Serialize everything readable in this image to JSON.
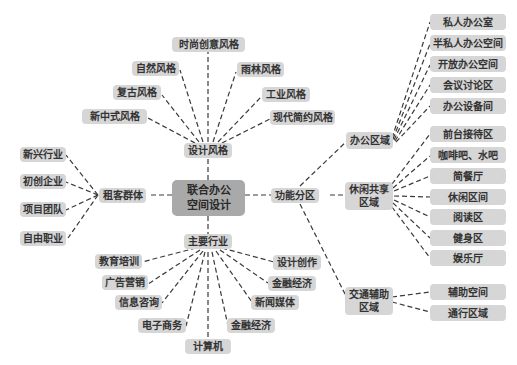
{
  "diagram": {
    "type": "mind-map",
    "colors": {
      "node": "#d6d6d6",
      "center": "#a9a9a9",
      "line": "#3a3a3a",
      "text": "#333333"
    },
    "center": {
      "line1": "联合办公",
      "line2": "空间设计"
    },
    "branches": {
      "design": {
        "label": "设计风格",
        "children": [
          "时尚创意风格",
          "自然风格",
          "雨林风格",
          "复古风格",
          "工业风格",
          "新中式风格",
          "现代简约风格"
        ]
      },
      "tenants": {
        "label": "租客群体",
        "children": [
          "新兴行业",
          "初创企业",
          "项目团队",
          "自由职业"
        ]
      },
      "industry": {
        "label": "主要行业",
        "children": [
          "教育培训",
          "广告营销",
          "信息咨询",
          "电子商务",
          "计算机",
          "金融经济",
          "新闻媒体",
          "金融经济",
          "设计创作"
        ]
      },
      "function": {
        "label": "功能分区",
        "sub": {
          "office": {
            "label": "办公区域",
            "children": [
              "私人办公室",
              "半私人办公空间",
              "开放办公空间",
              "会议讨论区",
              "办公设备间"
            ]
          },
          "leisure": {
            "line1": "休闲共享",
            "line2": "区域",
            "children": [
              "前台接待区",
              "咖啡吧、水吧",
              "简餐厅",
              "休闲区间",
              "阅读区",
              "健身区",
              "娱乐厅"
            ]
          },
          "traffic": {
            "line1": "交通辅助",
            "line2": "区域",
            "children": [
              "辅助空间",
              "通行区域"
            ]
          }
        }
      }
    }
  }
}
